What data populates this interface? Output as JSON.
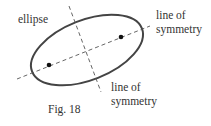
{
  "figure": {
    "caption": "Fig. 18",
    "labels": {
      "ellipse": "ellipse",
      "major_axis_line1": "line of",
      "major_axis_line2": "symmetry",
      "minor_axis_line1": "line of",
      "minor_axis_line2": "symmetry"
    },
    "colors": {
      "ellipse_stroke": "#444444",
      "axis_stroke": "#555555",
      "focus_fill": "#111111"
    }
  }
}
